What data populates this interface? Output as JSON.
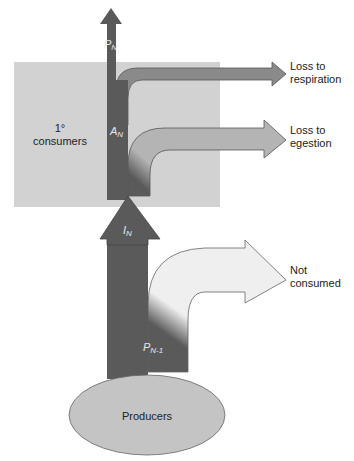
{
  "diagram": {
    "title": "",
    "colors": {
      "dark_flow": "#5a5a5a",
      "respiration_arrow": "#8a8a8a",
      "egestion_arrow": "#b4b4b4",
      "not_consumed_arrow": "#efefef",
      "consumer_box": "#d2d2d2",
      "producer_ellipse": "#c4c4c4",
      "outline": "#555555"
    },
    "nodes": {
      "consumers": {
        "label_main": "1°",
        "label_sub": "consumers"
      },
      "producers": {
        "label": "Producers"
      }
    },
    "flows": {
      "production_n": {
        "symbol": "P",
        "subscript": "N"
      },
      "assimilation_n": {
        "symbol": "A",
        "subscript": "N"
      },
      "ingestion_n": {
        "symbol": "I",
        "subscript": "N"
      },
      "production_n_minus_1": {
        "symbol": "P",
        "subscript": "N-1"
      }
    },
    "outputs": {
      "respiration": {
        "line1": "Loss to",
        "line2": "respiration"
      },
      "egestion": {
        "line1": "Loss to",
        "line2": "egestion"
      },
      "not_consumed": {
        "line1": "Not",
        "line2": "consumed"
      }
    }
  }
}
